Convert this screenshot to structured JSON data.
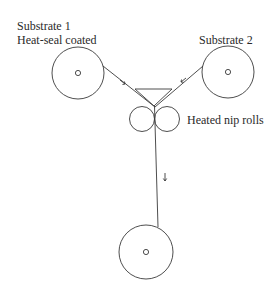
{
  "diagram": {
    "labels": {
      "substrate1_line1": "Substrate 1",
      "substrate1_line2": "Heat-seal coated",
      "substrate2": "Substrate 2",
      "nip_rolls": "Heated nip rolls"
    },
    "colors": {
      "stroke": "#3a3a3a",
      "background": "#ffffff"
    },
    "components": [
      {
        "id": "unwind-roll-1",
        "type": "roll",
        "cx": 78,
        "cy": 73,
        "r": 26
      },
      {
        "id": "unwind-roll-2",
        "type": "roll",
        "cx": 228,
        "cy": 72,
        "r": 26
      },
      {
        "id": "nip-roll-left",
        "type": "nip-roll",
        "cx": 142,
        "cy": 119,
        "r": 12.5
      },
      {
        "id": "nip-roll-right",
        "type": "nip-roll",
        "cx": 167,
        "cy": 119,
        "r": 12.5
      },
      {
        "id": "rewind-roll",
        "type": "roll",
        "cx": 146,
        "cy": 252,
        "r": 27
      },
      {
        "id": "heater-wedge",
        "type": "triangle"
      }
    ],
    "arrows": [
      {
        "id": "substrate1-direction",
        "direction": "down-right"
      },
      {
        "id": "substrate2-direction",
        "direction": "down-left"
      },
      {
        "id": "laminate-direction",
        "direction": "down"
      }
    ]
  }
}
